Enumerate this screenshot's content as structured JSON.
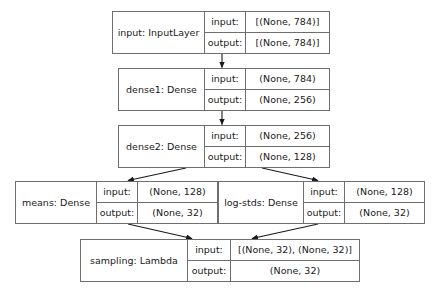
{
  "diagram": {
    "io_labels": {
      "input": "input:",
      "output": "output:"
    },
    "nodes": [
      {
        "id": "input",
        "name": "input: InputLayer",
        "input_shape": "[(None, 784)]",
        "output_shape": "[(None, 784)]"
      },
      {
        "id": "dense1",
        "name": "dense1: Dense",
        "input_shape": "(None, 784)",
        "output_shape": "(None, 256)"
      },
      {
        "id": "dense2",
        "name": "dense2: Dense",
        "input_shape": "(None, 256)",
        "output_shape": "(None, 128)"
      },
      {
        "id": "means",
        "name": "means: Dense",
        "input_shape": "(None, 128)",
        "output_shape": "(None, 32)"
      },
      {
        "id": "log-stds",
        "name": "log-stds: Dense",
        "input_shape": "(None, 128)",
        "output_shape": "(None, 32)"
      },
      {
        "id": "sampling",
        "name": "sampling: Lambda",
        "input_shape": "[(None, 32), (None, 32)]",
        "output_shape": "(None, 32)"
      }
    ],
    "edges": [
      {
        "from": "input",
        "to": "dense1"
      },
      {
        "from": "dense1",
        "to": "dense2"
      },
      {
        "from": "dense2",
        "to": "means"
      },
      {
        "from": "dense2",
        "to": "log-stds"
      },
      {
        "from": "means",
        "to": "sampling"
      },
      {
        "from": "log-stds",
        "to": "sampling"
      }
    ],
    "colors": {
      "border": "#6e6e6e",
      "edge": "#1a1a1a",
      "background": "#ffffff",
      "text": "#1a1a1a"
    }
  }
}
